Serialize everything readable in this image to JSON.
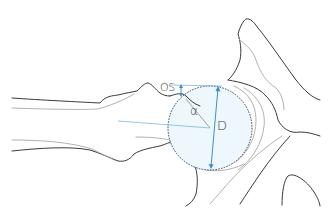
{
  "diagram": {
    "type": "anatomical-line-drawing",
    "labels": {
      "offset": "OS",
      "angle": "α",
      "diameter": "D"
    },
    "colors": {
      "outline": "#3a3a3a",
      "light_outline": "#a8a8a8",
      "measurement": "#3d8fc7",
      "head_fill": "#eef7fc",
      "head_outline": "#2f4a66"
    }
  }
}
